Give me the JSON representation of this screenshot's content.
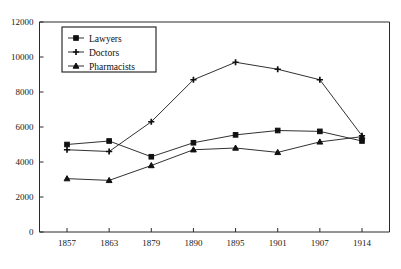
{
  "chart_data": {
    "type": "line",
    "title": "",
    "xlabel": "",
    "ylabel": "",
    "x": [
      "1857",
      "1863",
      "1879",
      "1890",
      "1895",
      "1901",
      "1907",
      "1914"
    ],
    "categories": [
      "1857",
      "1863",
      "1879",
      "1890",
      "1895",
      "1901",
      "1907",
      "1914"
    ],
    "ylim": [
      0,
      12000
    ],
    "ytick_values": [
      0,
      2000,
      4000,
      6000,
      8000,
      10000,
      12000
    ],
    "ytick_labels": [
      "0",
      "2000",
      "4000",
      "6000",
      "8000",
      "10000",
      "12000"
    ],
    "xtick_labels": [
      "1857",
      "1863",
      "1879",
      "1890",
      "1895",
      "1901",
      "1907",
      "1914"
    ],
    "grid": false,
    "legend_position": "upper-left-inside",
    "series": [
      {
        "name": "Lawyers",
        "marker": "square",
        "values": [
          5000,
          5200,
          4300,
          5100,
          5550,
          5800,
          5750,
          5200
        ]
      },
      {
        "name": "Doctors",
        "marker": "plus",
        "values": [
          4700,
          4600,
          6300,
          8700,
          9700,
          9300,
          8700,
          5500
        ]
      },
      {
        "name": "Pharmacists",
        "marker": "triangle",
        "values": [
          3050,
          2950,
          3800,
          4700,
          4800,
          4550,
          5150,
          5450
        ]
      }
    ]
  },
  "legend": {
    "entries": [
      {
        "label": "Lawyers",
        "marker": "square"
      },
      {
        "label": "Doctors",
        "marker": "plus"
      },
      {
        "label": "Pharmacists",
        "marker": "triangle"
      }
    ]
  },
  "colors": {
    "ink": "#101010",
    "axis": "#2a2a2a",
    "background": "#ffffff"
  }
}
